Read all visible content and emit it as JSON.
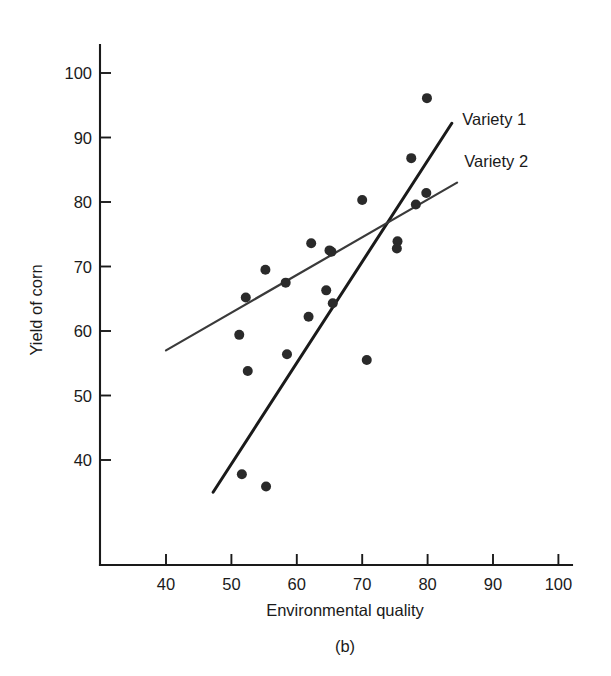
{
  "figure": {
    "caption": "(b)",
    "point_color": "#2a2a2a",
    "axis_color": "#1a1a1a"
  },
  "chart_data": {
    "type": "scatter",
    "title": "",
    "xlabel": "Environmental quality",
    "ylabel": "Yield of corn",
    "xlim": [
      33,
      103
    ],
    "ylim": [
      31,
      104
    ],
    "xticks": [
      40,
      50,
      60,
      70,
      80,
      90,
      100
    ],
    "yticks": [
      40,
      50,
      60,
      70,
      80,
      90,
      100
    ],
    "grid": false,
    "legend_position": "inline-right",
    "series": [
      {
        "name": "Variety 1",
        "color": "#1a1a1a",
        "points": [
          {
            "x": 51.6,
            "y": 37.8
          },
          {
            "x": 55.3,
            "y": 35.9
          },
          {
            "x": 61.8,
            "y": 62.2
          },
          {
            "x": 64.5,
            "y": 66.3
          },
          {
            "x": 65.5,
            "y": 64.3
          },
          {
            "x": 70.7,
            "y": 55.5
          },
          {
            "x": 75.4,
            "y": 73.9
          },
          {
            "x": 78.2,
            "y": 79.6
          },
          {
            "x": 79.8,
            "y": 81.4
          },
          {
            "x": 79.9,
            "y": 96.1
          }
        ],
        "fit_line": {
          "x1": 47.2,
          "y1": 35.0,
          "x2": 83.7,
          "y2": 92.2
        }
      },
      {
        "name": "Variety 2",
        "color": "#3a3a3a",
        "points": [
          {
            "x": 51.2,
            "y": 59.4
          },
          {
            "x": 52.2,
            "y": 65.2
          },
          {
            "x": 52.5,
            "y": 53.8
          },
          {
            "x": 55.2,
            "y": 69.5
          },
          {
            "x": 58.3,
            "y": 67.5
          },
          {
            "x": 58.5,
            "y": 56.4
          },
          {
            "x": 62.2,
            "y": 73.6
          },
          {
            "x": 65.0,
            "y": 72.5
          },
          {
            "x": 65.3,
            "y": 72.3
          },
          {
            "x": 70.0,
            "y": 80.3
          },
          {
            "x": 75.3,
            "y": 72.8
          },
          {
            "x": 77.5,
            "y": 86.8
          }
        ],
        "fit_line": {
          "x1": 40.0,
          "y1": 57.0,
          "x2": 84.5,
          "y2": 83.0
        }
      }
    ],
    "annotations": [
      {
        "text": "Variety 1",
        "x": 85.3,
        "y": 92.8
      },
      {
        "text": "Variety 2",
        "x": 85.6,
        "y": 86.3
      }
    ]
  }
}
